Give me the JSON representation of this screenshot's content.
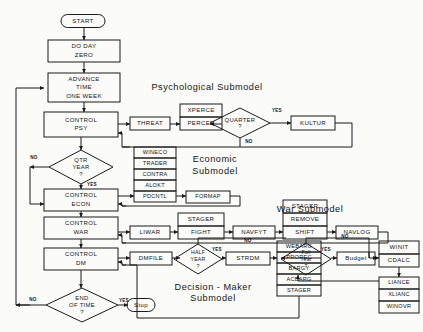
{
  "diagram": {
    "type": "flowchart",
    "background_color": "#fbfbfa",
    "line_color": "#1b1b1b",
    "shape_fill": "#ffffff"
  },
  "terminators": [
    {
      "id": "start",
      "label": "START",
      "x": 83,
      "y": 21
    },
    {
      "id": "stop",
      "label": "Stop",
      "x": 141,
      "y": 305
    }
  ],
  "section_titles": [
    {
      "id": "psych",
      "line1": "Psychological  Submodel",
      "x": 207,
      "y": 88
    },
    {
      "id": "econ",
      "line1": "Economic",
      "line2": "Submodel",
      "x": 215,
      "y": 160,
      "y2": 172
    },
    {
      "id": "war",
      "line1": "War Submodel",
      "x": 310,
      "y": 210
    },
    {
      "id": "dm",
      "line1": "Decision - Maker",
      "line2": "Submodel",
      "x": 213,
      "y": 288,
      "y2": 299
    }
  ],
  "process_boxes": [
    {
      "id": "do-day-zero",
      "lines": [
        "DO  DAY",
        "ZERO"
      ],
      "x": 48,
      "y": 40,
      "w": 72,
      "h": 22
    },
    {
      "id": "advance-time",
      "lines": [
        "ADVANCE",
        "TIME",
        "ONE WEEK"
      ],
      "x": 48,
      "y": 73,
      "w": 72,
      "h": 29
    },
    {
      "id": "control-psy",
      "lines": [
        "CONTROL",
        "PSY"
      ],
      "x": 44,
      "y": 112,
      "w": 74,
      "h": 25
    },
    {
      "id": "threat",
      "lines": [
        "THREAT"
      ],
      "x": 130,
      "y": 117,
      "w": 40,
      "h": 13
    },
    {
      "id": "xperce",
      "lines": [
        "XPERCE"
      ],
      "x": 180,
      "y": 104,
      "w": 42,
      "h": 13
    },
    {
      "id": "percep",
      "lines": [
        "PERCEP"
      ],
      "x": 180,
      "y": 117,
      "w": 42,
      "h": 13
    },
    {
      "id": "kultur",
      "lines": [
        "KULTUR"
      ],
      "x": 291,
      "y": 116,
      "w": 44,
      "h": 14
    },
    {
      "id": "wineco",
      "lines": [
        "WINECO"
      ],
      "x": 134,
      "y": 147,
      "w": 42,
      "h": 11
    },
    {
      "id": "trader",
      "lines": [
        "TRADER"
      ],
      "x": 134,
      "y": 158,
      "w": 42,
      "h": 11
    },
    {
      "id": "contra",
      "lines": [
        "CONTRA"
      ],
      "x": 134,
      "y": 169,
      "w": 42,
      "h": 11
    },
    {
      "id": "alokt",
      "lines": [
        "ALOKT"
      ],
      "x": 134,
      "y": 180,
      "w": 42,
      "h": 11
    },
    {
      "id": "pdcntl",
      "lines": [
        "PDCNTL"
      ],
      "x": 134,
      "y": 191,
      "w": 42,
      "h": 11
    },
    {
      "id": "control-econ",
      "lines": [
        "CONTROL",
        "ECON"
      ],
      "x": 44,
      "y": 189,
      "w": 74,
      "h": 22
    },
    {
      "id": "formap",
      "lines": [
        "FORMAP"
      ],
      "x": 186,
      "y": 191,
      "w": 44,
      "h": 12
    },
    {
      "id": "control-war",
      "lines": [
        "CONTROL",
        "WAR"
      ],
      "x": 44,
      "y": 217,
      "w": 74,
      "h": 22
    },
    {
      "id": "liwar",
      "lines": [
        "LIWAR"
      ],
      "x": 130,
      "y": 226,
      "w": 40,
      "h": 13
    },
    {
      "id": "stager-1",
      "lines": [
        "STAGER"
      ],
      "x": 178,
      "y": 213,
      "w": 46,
      "h": 13
    },
    {
      "id": "fight",
      "lines": [
        "FIGHT"
      ],
      "x": 178,
      "y": 226,
      "w": 46,
      "h": 13
    },
    {
      "id": "navfyt",
      "lines": [
        "NAVFYT"
      ],
      "x": 233,
      "y": 226,
      "w": 42,
      "h": 13
    },
    {
      "id": "stager-2",
      "lines": [
        "STAGER"
      ],
      "x": 283,
      "y": 200,
      "w": 44,
      "h": 13
    },
    {
      "id": "remove",
      "lines": [
        "REMOVE"
      ],
      "x": 283,
      "y": 213,
      "w": 44,
      "h": 13
    },
    {
      "id": "shift",
      "lines": [
        "SHIFT"
      ],
      "x": 283,
      "y": 226,
      "w": 44,
      "h": 13
    },
    {
      "id": "navlog",
      "lines": [
        "NAVLOG"
      ],
      "x": 336,
      "y": 226,
      "w": 42,
      "h": 13
    },
    {
      "id": "control-dm",
      "lines": [
        "CONTROL",
        "DM"
      ],
      "x": 44,
      "y": 248,
      "w": 74,
      "h": 22
    },
    {
      "id": "dmfile",
      "lines": [
        "DMFILE"
      ],
      "x": 130,
      "y": 252,
      "w": 42,
      "h": 13
    },
    {
      "id": "strdm",
      "lines": [
        "STRDM"
      ],
      "x": 226,
      "y": 252,
      "w": 44,
      "h": 13
    },
    {
      "id": "webarg",
      "lines": [
        "WEBARG"
      ],
      "x": 277,
      "y": 241,
      "w": 44,
      "h": 11
    },
    {
      "id": "prorec",
      "lines": [
        "PROREC"
      ],
      "x": 277,
      "y": 252,
      "w": 44,
      "h": 11
    },
    {
      "id": "bargy",
      "lines": [
        "BARGY"
      ],
      "x": 277,
      "y": 263,
      "w": 44,
      "h": 11
    },
    {
      "id": "acbarg",
      "lines": [
        "ACBARG"
      ],
      "x": 277,
      "y": 274,
      "w": 44,
      "h": 11
    },
    {
      "id": "stager-3",
      "lines": [
        "STAGER"
      ],
      "x": 277,
      "y": 285,
      "w": 44,
      "h": 11
    },
    {
      "id": "budget",
      "lines": [
        "Budget"
      ],
      "x": 337,
      "y": 252,
      "w": 38,
      "h": 13
    },
    {
      "id": "winit",
      "lines": [
        "WINIT"
      ],
      "x": 379,
      "y": 241,
      "w": 40,
      "h": 13
    },
    {
      "id": "cdalc",
      "lines": [
        "CDALC"
      ],
      "x": 379,
      "y": 254,
      "w": 40,
      "h": 13
    },
    {
      "id": "liance",
      "lines": [
        "LIANCE"
      ],
      "x": 379,
      "y": 277,
      "w": 40,
      "h": 12
    },
    {
      "id": "xlianc",
      "lines": [
        "XLIANC"
      ],
      "x": 379,
      "y": 289,
      "w": 40,
      "h": 12
    },
    {
      "id": "winovr",
      "lines": [
        "WINOVR"
      ],
      "x": 379,
      "y": 301,
      "w": 40,
      "h": 12
    }
  ],
  "decision_diamonds": [
    {
      "id": "quarter",
      "lines": [
        "QUARTER",
        "?"
      ],
      "cx": 240,
      "cy": 123,
      "rx": 30,
      "ry": 15,
      "yes": "YES",
      "no": "NO"
    },
    {
      "id": "qtr-year",
      "lines": [
        "QTR",
        "YEAR",
        "?"
      ],
      "cx": 81,
      "cy": 167,
      "rx": 32,
      "ry": 17,
      "yes": "YES",
      "no": "NO"
    },
    {
      "id": "half-year",
      "lines": [
        "HALF",
        "YEAR",
        "?"
      ],
      "cx": 198,
      "cy": 259,
      "rx": 24,
      "ry": 15,
      "yes": "YES",
      "no": "NO"
    },
    {
      "id": "full-year",
      "lines": [
        "Full",
        "Year",
        "?"
      ],
      "cx": 306,
      "cy": 259,
      "rx": 25,
      "ry": 16,
      "yes": "YES",
      "no": "NO"
    },
    {
      "id": "end-of-time",
      "lines": [
        "END",
        "OF TIME",
        "?"
      ],
      "cx": 82,
      "cy": 305,
      "rx": 36,
      "ry": 17,
      "yes": "YES",
      "no": "NO"
    }
  ],
  "edge_labels": [
    {
      "id": "quarter-yes",
      "text": "YES",
      "x": 277,
      "y": 111
    },
    {
      "id": "quarter-no",
      "text": "NO",
      "x": 249,
      "y": 142
    },
    {
      "id": "qtr-no",
      "text": "NO",
      "x": 34,
      "y": 158
    },
    {
      "id": "qtr-yes",
      "text": "YES",
      "x": 92,
      "y": 185
    },
    {
      "id": "halfyear-yes",
      "text": "YES",
      "x": 217,
      "y": 250
    },
    {
      "id": "halfyear-no",
      "text": "NO",
      "x": 248,
      "y": 241
    },
    {
      "id": "fullyear-yes",
      "text": "YES",
      "x": 326,
      "y": 250
    },
    {
      "id": "fullyear-no",
      "text": "NO",
      "x": 345,
      "y": 237
    },
    {
      "id": "endtime-yes",
      "text": "YES",
      "x": 124,
      "y": 301
    },
    {
      "id": "endtime-no",
      "text": "NO",
      "x": 33,
      "y": 300
    }
  ]
}
